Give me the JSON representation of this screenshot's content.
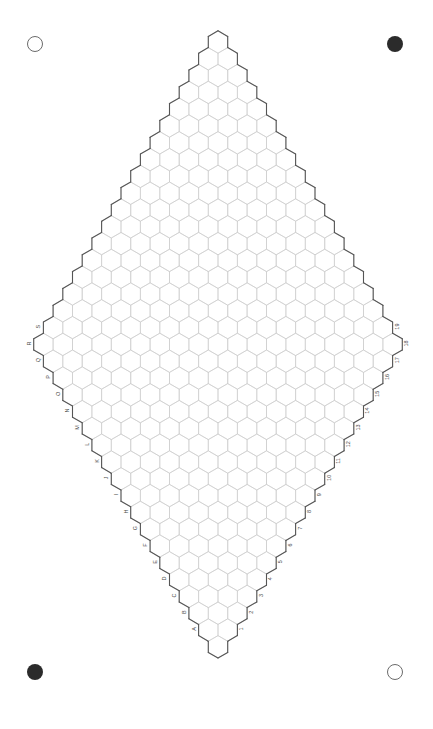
{
  "page": {
    "width": 433,
    "height": 729,
    "background": "#ffffff"
  },
  "registration_marks": [
    {
      "name": "top-left",
      "style": "hollow",
      "x": 35,
      "y": 44,
      "radius": 8,
      "color": "#6b6b6b"
    },
    {
      "name": "top-right",
      "style": "filled",
      "x": 395,
      "y": 44,
      "radius": 8,
      "color": "#2b2b2b"
    },
    {
      "name": "bottom-left",
      "style": "filled",
      "x": 35,
      "y": 672,
      "radius": 8,
      "color": "#2b2b2b"
    },
    {
      "name": "bottom-right",
      "style": "hollow",
      "x": 395,
      "y": 672,
      "radius": 8,
      "color": "#6b6b6b"
    }
  ],
  "grid": {
    "shape": "rhombus",
    "orientation": "pointy-top",
    "rows": 37,
    "max_row_cells": 19,
    "hex_width": 19.4,
    "hex_height": 22.4,
    "row_pitch": 16.8,
    "top_vertex": {
      "x": 218,
      "y": 42
    },
    "bottom_vertex": {
      "x": 218,
      "y": 690
    },
    "left_vertex": {
      "x": 25,
      "y": 375
    },
    "right_vertex": {
      "x": 412,
      "y": 375
    },
    "interior_stroke": "#c9c9c9",
    "interior_stroke_width": 0.6,
    "outline_stroke": "#555555",
    "outline_stroke_width": 1.1
  },
  "axis_labels": {
    "left_edge": {
      "name": "row-letters",
      "description": "Letter labels along lower-left edge, bottom to top",
      "values": [
        "A",
        "B",
        "C",
        "D",
        "E",
        "F",
        "G",
        "H",
        "I",
        "J",
        "K",
        "L",
        "M",
        "N",
        "O",
        "P",
        "Q",
        "R",
        "S"
      ],
      "rotation_deg": -90,
      "color": "#4a4a4a",
      "font_size": 5.5
    },
    "right_edge": {
      "name": "column-numbers",
      "description": "Number labels along lower-right edge, bottom to top",
      "values": [
        "1",
        "2",
        "3",
        "4",
        "5",
        "6",
        "7",
        "8",
        "9",
        "10",
        "11",
        "12",
        "13",
        "14",
        "15",
        "16",
        "17",
        "18",
        "19"
      ],
      "rotation_deg": -90,
      "color": "#4a4a4a",
      "font_size": 5.5
    }
  }
}
